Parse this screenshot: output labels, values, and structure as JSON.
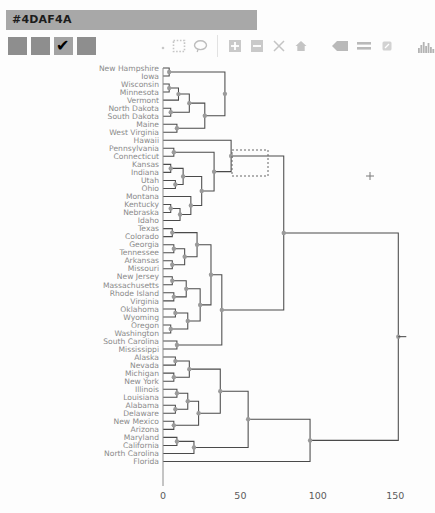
{
  "header": {
    "color_code": "#4DAF4A",
    "bar_color": "#a8a8a8"
  },
  "swatches": [
    {
      "name": "swatch-1",
      "color": "#8e8e8e",
      "checked": false
    },
    {
      "name": "swatch-2",
      "color": "#8e8e8e",
      "checked": false
    },
    {
      "name": "swatch-3",
      "color": "#a3a3a3",
      "checked": true,
      "mark": "✔"
    },
    {
      "name": "swatch-4",
      "color": "#8e8e8e",
      "checked": false
    }
  ],
  "toolbar": {
    "icons": [
      "pointer-dot-icon",
      "marquee-select-icon",
      "lasso-select-icon",
      "zoom-in-icon",
      "zoom-out-icon",
      "cut-scissors-icon",
      "home-reset-icon",
      "back-arrow-icon",
      "list-lines-icon",
      "eraser-icon",
      "histogram-icon"
    ]
  },
  "chart_data": {
    "type": "dendrogram",
    "title": "",
    "xlabel": "",
    "ylabel": "",
    "xlim": [
      0,
      168
    ],
    "ticks": [
      0,
      50,
      100,
      150
    ],
    "tick_labels": [
      "0",
      "50",
      "100",
      "150"
    ],
    "grid": false,
    "leaves": [
      "New Hampshire",
      "Iowa",
      "Wisconsin",
      "Minnesota",
      "Vermont",
      "North Dakota",
      "South Dakota",
      "Maine",
      "West Virginia",
      "Hawaii",
      "Pennsylvania",
      "Connecticut",
      "Kansas",
      "Indiana",
      "Utah",
      "Ohio",
      "Montana",
      "Kentucky",
      "Nebraska",
      "Idaho",
      "Texas",
      "Colorado",
      "Georgia",
      "Tennessee",
      "Arkansas",
      "Missouri",
      "New Jersey",
      "Massachusetts",
      "Rhode Island",
      "Virginia",
      "Oklahoma",
      "Wyoming",
      "Oregon",
      "Washington",
      "South Carolina",
      "Mississippi",
      "Alaska",
      "Nevada",
      "Michigan",
      "New York",
      "Illinois",
      "Louisiana",
      "Alabama",
      "Delaware",
      "New Mexico",
      "Arizona",
      "Maryland",
      "California",
      "North Carolina",
      "Florida"
    ],
    "merges": [
      {
        "id": 50,
        "a": 0,
        "b": 1,
        "h": 4
      },
      {
        "id": 51,
        "a": 2,
        "b": 3,
        "h": 4
      },
      {
        "id": 52,
        "a": 51,
        "b": 4,
        "h": 10
      },
      {
        "id": 53,
        "a": 5,
        "b": 6,
        "h": 5
      },
      {
        "id": 54,
        "a": 52,
        "b": 53,
        "h": 17
      },
      {
        "id": 55,
        "a": 7,
        "b": 8,
        "h": 9
      },
      {
        "id": 56,
        "a": 54,
        "b": 55,
        "h": 27
      },
      {
        "id": 57,
        "a": 50,
        "b": 56,
        "h": 40
      },
      {
        "id": 58,
        "a": 10,
        "b": 11,
        "h": 7
      },
      {
        "id": 59,
        "a": 12,
        "b": 13,
        "h": 5
      },
      {
        "id": 60,
        "a": 14,
        "b": 15,
        "h": 8
      },
      {
        "id": 61,
        "a": 59,
        "b": 60,
        "h": 13
      },
      {
        "id": 62,
        "a": 17,
        "b": 18,
        "h": 5
      },
      {
        "id": 63,
        "a": 62,
        "b": 19,
        "h": 11
      },
      {
        "id": 64,
        "a": 16,
        "b": 63,
        "h": 18
      },
      {
        "id": 65,
        "a": 61,
        "b": 64,
        "h": 25
      },
      {
        "id": 66,
        "a": 58,
        "b": 65,
        "h": 33
      },
      {
        "id": 67,
        "a": 9,
        "b": 66,
        "h": 44
      },
      {
        "id": 68,
        "a": 20,
        "b": 21,
        "h": 6
      },
      {
        "id": 69,
        "a": 22,
        "b": 23,
        "h": 7
      },
      {
        "id": 70,
        "a": 24,
        "b": 25,
        "h": 6
      },
      {
        "id": 71,
        "a": 69,
        "b": 70,
        "h": 14
      },
      {
        "id": 72,
        "a": 68,
        "b": 71,
        "h": 22
      },
      {
        "id": 73,
        "a": 26,
        "b": 27,
        "h": 6
      },
      {
        "id": 74,
        "a": 28,
        "b": 29,
        "h": 7
      },
      {
        "id": 75,
        "a": 73,
        "b": 74,
        "h": 15
      },
      {
        "id": 76,
        "a": 30,
        "b": 31,
        "h": 8
      },
      {
        "id": 77,
        "a": 32,
        "b": 33,
        "h": 5
      },
      {
        "id": 78,
        "a": 76,
        "b": 77,
        "h": 16
      },
      {
        "id": 79,
        "a": 75,
        "b": 78,
        "h": 24
      },
      {
        "id": 80,
        "a": 72,
        "b": 79,
        "h": 31
      },
      {
        "id": 81,
        "a": 34,
        "b": 35,
        "h": 9
      },
      {
        "id": 82,
        "a": 80,
        "b": 81,
        "h": 38
      },
      {
        "id": 83,
        "a": 67,
        "b": 82,
        "h": 78
      },
      {
        "id": 84,
        "a": 36,
        "b": 37,
        "h": 8
      },
      {
        "id": 85,
        "a": 38,
        "b": 39,
        "h": 7
      },
      {
        "id": 86,
        "a": 84,
        "b": 85,
        "h": 17
      },
      {
        "id": 87,
        "a": 40,
        "b": 41,
        "h": 9
      },
      {
        "id": 88,
        "a": 42,
        "b": 43,
        "h": 8
      },
      {
        "id": 89,
        "a": 87,
        "b": 88,
        "h": 16
      },
      {
        "id": 90,
        "a": 44,
        "b": 45,
        "h": 7
      },
      {
        "id": 91,
        "a": 89,
        "b": 90,
        "h": 23
      },
      {
        "id": 92,
        "a": 86,
        "b": 91,
        "h": 37
      },
      {
        "id": 93,
        "a": 46,
        "b": 47,
        "h": 9
      },
      {
        "id": 94,
        "a": 93,
        "b": 48,
        "h": 20
      },
      {
        "id": 95,
        "a": 92,
        "b": 94,
        "h": 55
      },
      {
        "id": 96,
        "a": 95,
        "b": 49,
        "h": 95
      },
      {
        "id": 97,
        "a": 83,
        "b": 96,
        "h": 152
      }
    ],
    "selection_box": {
      "node_id": 83,
      "x": 232,
      "y": 150,
      "w": 36,
      "h": 26
    },
    "cursor_marker": {
      "symbol": "+",
      "x": 370,
      "y": 176
    }
  },
  "axis": {
    "origin_x": 163,
    "pixels_per_unit": 1.548
  }
}
